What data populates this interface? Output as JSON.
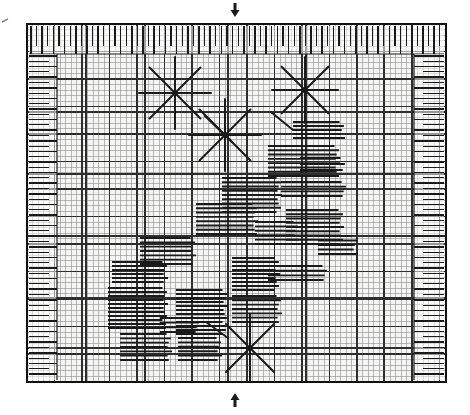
{
  "document": {
    "kind": "scanned-graph-chart",
    "title": "Grid recording chart with starburst markers",
    "background_color": "#ffffff",
    "ink_color": "#1a1a1a",
    "grid_minor_color": "#7b7b7b",
    "grid_major_color": "#2e2e2e",
    "frame_color": "#111111",
    "paper_tint": "#f4f4f2"
  },
  "frame": {
    "x": 27,
    "y": 24,
    "width": 419,
    "height": 358,
    "border_width": 2
  },
  "grid": {
    "minor_step": 5.5,
    "major_every": 5,
    "minor_width": 0.5,
    "major_width": 1.1,
    "plot": {
      "x": 27,
      "y": 24,
      "width": 419,
      "height": 358
    }
  },
  "markers": {
    "top_arrow": {
      "glyph": "down-arrow",
      "x": 235,
      "y": 10,
      "direction": "down"
    },
    "bottom_arrow": {
      "glyph": "up-arrow",
      "x": 235,
      "y": 400,
      "direction": "up"
    },
    "left_edge_tick": {
      "x": 5,
      "y": 22,
      "label": "edge-tick"
    }
  },
  "bands": {
    "top_ticks": {
      "name": "top-tick-band",
      "x": 29,
      "y": 26,
      "width": 415,
      "height": 28,
      "orientation": "vertical-ticks",
      "count": 74,
      "spacing": 5.6,
      "tall_every": 2
    },
    "left_ticks": {
      "name": "left-tick-band",
      "x": 29,
      "y": 54,
      "width": 28,
      "height": 326,
      "orientation": "horizontal-ticks",
      "count": 62,
      "spacing": 5.3
    },
    "right_ticks": {
      "name": "right-tick-band",
      "x": 414,
      "y": 54,
      "width": 30,
      "height": 326,
      "orientation": "horizontal-ticks",
      "count": 62,
      "spacing": 5.3
    }
  },
  "chart_data": {
    "type": "scatter",
    "xlabel": "",
    "ylabel": "",
    "xlim": [
      27,
      446
    ],
    "ylim": [
      24,
      382
    ],
    "grid": true,
    "legend": "none",
    "starbursts": [
      {
        "name": "starburst-1",
        "cx": 175,
        "cy": 93,
        "radius": 36,
        "rays": 8
      },
      {
        "name": "starburst-2",
        "cx": 305,
        "cy": 90,
        "radius": 33,
        "rays": 8
      },
      {
        "name": "starburst-3",
        "cx": 225,
        "cy": 135,
        "radius": 36,
        "rays": 8
      },
      {
        "name": "starburst-4",
        "cx": 250,
        "cy": 348,
        "radius": 34,
        "rays": 8
      }
    ],
    "bar_clusters": [
      {
        "name": "cluster-a",
        "x": 293,
        "y": 122,
        "width": 52,
        "height": 16,
        "lines": 5
      },
      {
        "name": "cluster-b",
        "x": 268,
        "y": 146,
        "width": 72,
        "height": 30,
        "lines": 8
      },
      {
        "name": "cluster-c",
        "x": 222,
        "y": 178,
        "width": 60,
        "height": 34,
        "lines": 9
      },
      {
        "name": "cluster-d",
        "x": 281,
        "y": 182,
        "width": 66,
        "height": 14,
        "lines": 4
      },
      {
        "name": "cluster-e",
        "x": 196,
        "y": 204,
        "width": 62,
        "height": 30,
        "lines": 8
      },
      {
        "name": "cluster-f",
        "x": 286,
        "y": 210,
        "width": 58,
        "height": 34,
        "lines": 9
      },
      {
        "name": "cluster-g",
        "x": 255,
        "y": 222,
        "width": 44,
        "height": 22,
        "lines": 6
      },
      {
        "name": "cluster-h",
        "x": 140,
        "y": 238,
        "width": 56,
        "height": 26,
        "lines": 7
      },
      {
        "name": "cluster-i",
        "x": 318,
        "y": 236,
        "width": 40,
        "height": 18,
        "lines": 5
      },
      {
        "name": "cluster-j",
        "x": 112,
        "y": 262,
        "width": 56,
        "height": 20,
        "lines": 6
      },
      {
        "name": "cluster-k",
        "x": 232,
        "y": 258,
        "width": 48,
        "height": 32,
        "lines": 9
      },
      {
        "name": "cluster-l",
        "x": 268,
        "y": 266,
        "width": 60,
        "height": 14,
        "lines": 4
      },
      {
        "name": "cluster-m",
        "x": 108,
        "y": 288,
        "width": 60,
        "height": 40,
        "lines": 11
      },
      {
        "name": "cluster-n",
        "x": 176,
        "y": 290,
        "width": 52,
        "height": 44,
        "lines": 12
      },
      {
        "name": "cluster-o",
        "x": 232,
        "y": 296,
        "width": 50,
        "height": 26,
        "lines": 7
      },
      {
        "name": "cluster-p",
        "x": 120,
        "y": 334,
        "width": 52,
        "height": 26,
        "lines": 7
      },
      {
        "name": "cluster-q",
        "x": 178,
        "y": 338,
        "width": 44,
        "height": 22,
        "lines": 6
      },
      {
        "name": "cluster-r",
        "x": 300,
        "y": 158,
        "width": 46,
        "height": 12,
        "lines": 3
      },
      {
        "name": "cluster-s",
        "x": 160,
        "y": 318,
        "width": 40,
        "height": 14,
        "lines": 4
      }
    ],
    "connector_segments": [
      {
        "name": "connector-1",
        "x1": 205,
        "y1": 116,
        "x2": 232,
        "y2": 142
      },
      {
        "name": "connector-2",
        "x1": 271,
        "y1": 112,
        "x2": 293,
        "y2": 130
      },
      {
        "name": "connector-3",
        "x1": 206,
        "y1": 322,
        "x2": 228,
        "y2": 338
      }
    ],
    "heavy_rules": [
      {
        "name": "rule-h1",
        "y": 112
      },
      {
        "name": "rule-h2",
        "y": 174
      },
      {
        "name": "rule-h3",
        "y": 236
      },
      {
        "name": "rule-h4",
        "y": 298
      },
      {
        "name": "rule-h5",
        "y": 348
      },
      {
        "name": "rule-v1",
        "x": 86
      },
      {
        "name": "rule-v2",
        "x": 145
      },
      {
        "name": "rule-v3",
        "x": 228
      },
      {
        "name": "rule-v4",
        "x": 306
      },
      {
        "name": "rule-v5",
        "x": 384
      }
    ]
  }
}
